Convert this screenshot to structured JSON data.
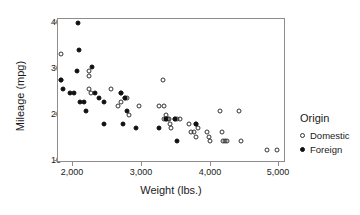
{
  "chart_data": {
    "type": "scatter",
    "title": "",
    "xlabel": "Weight (lbs.)",
    "ylabel": "Mileage (mpg)",
    "xlim": [
      1760,
      4960
    ],
    "ylim": [
      9,
      42
    ],
    "xticks": [
      2000,
      3000,
      4000,
      5000
    ],
    "xticklabels": [
      "2,000",
      "3,000",
      "4,000",
      "5,000"
    ],
    "yticks": [
      10,
      20,
      30,
      40
    ],
    "yticklabels": [
      "10",
      "20",
      "30",
      "40"
    ],
    "grid": false,
    "legend": {
      "title": "Origin",
      "position": "right",
      "entries": [
        {
          "name": "Domestic",
          "marker": "open-circle",
          "color": "#333333"
        },
        {
          "name": "Foreign",
          "marker": "filled-circle",
          "color": "#111111"
        }
      ]
    },
    "series": [
      {
        "name": "Domestic",
        "marker": "open-circle",
        "color": "#333333",
        "points": [
          [
            1800,
            34
          ],
          [
            1800,
            28
          ],
          [
            2200,
            26
          ],
          [
            2230,
            25
          ],
          [
            2200,
            29
          ],
          [
            2200,
            30
          ],
          [
            2500,
            26
          ],
          [
            2600,
            22
          ],
          [
            2640,
            23
          ],
          [
            2650,
            25
          ],
          [
            2700,
            24
          ],
          [
            2730,
            24
          ],
          [
            2750,
            20
          ],
          [
            2900,
            22
          ],
          [
            3180,
            22
          ],
          [
            3250,
            22
          ],
          [
            3230,
            28
          ],
          [
            3250,
            19
          ],
          [
            3270,
            20
          ],
          [
            3280,
            19
          ],
          [
            3300,
            19
          ],
          [
            3320,
            19
          ],
          [
            3330,
            18
          ],
          [
            3350,
            17
          ],
          [
            3400,
            19
          ],
          [
            3430,
            19
          ],
          [
            3470,
            19
          ],
          [
            3600,
            18
          ],
          [
            3630,
            16
          ],
          [
            3670,
            16
          ],
          [
            3700,
            18
          ],
          [
            3720,
            17
          ],
          [
            3700,
            15
          ],
          [
            3850,
            16
          ],
          [
            3880,
            15
          ],
          [
            3900,
            14
          ],
          [
            4030,
            21
          ],
          [
            4060,
            16
          ],
          [
            4080,
            14
          ],
          [
            4100,
            14
          ],
          [
            4130,
            14
          ],
          [
            4300,
            21
          ],
          [
            4330,
            14
          ],
          [
            4700,
            12
          ],
          [
            4840,
            12
          ]
        ]
      },
      {
        "name": "Foreign",
        "marker": "filled-circle",
        "color": "#111111",
        "points": [
          [
            2040,
            41
          ],
          [
            2050,
            35
          ],
          [
            1800,
            28
          ],
          [
            1830,
            26
          ],
          [
            1930,
            25
          ],
          [
            1990,
            25
          ],
          [
            2020,
            30
          ],
          [
            2070,
            23
          ],
          [
            2130,
            23
          ],
          [
            2150,
            21
          ],
          [
            2240,
            31
          ],
          [
            2280,
            25
          ],
          [
            2330,
            24
          ],
          [
            2400,
            23
          ],
          [
            2400,
            18
          ],
          [
            2650,
            25
          ],
          [
            2670,
            18
          ],
          [
            2700,
            24
          ],
          [
            2730,
            21
          ],
          [
            2850,
            17
          ],
          [
            3180,
            17
          ],
          [
            3280,
            19
          ],
          [
            3400,
            19
          ],
          [
            3430,
            14
          ],
          [
            3700,
            18
          ]
        ]
      }
    ]
  }
}
